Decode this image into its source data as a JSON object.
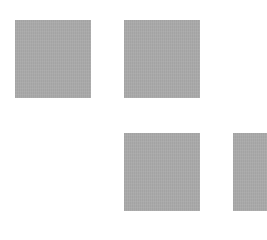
{
  "canvas": {
    "width": 267,
    "height": 224,
    "background": "#ffffff"
  },
  "tiles": [
    {
      "id": "tile-1",
      "row": 1,
      "col": 1,
      "color": "#aaaaaa"
    },
    {
      "id": "tile-2",
      "row": 1,
      "col": 2,
      "color": "#aaaaaa"
    },
    {
      "id": "tile-3",
      "row": 2,
      "col": 2,
      "color": "#aaaaaa"
    },
    {
      "id": "tile-4",
      "row": 2,
      "col": 3,
      "color": "#aaaaaa",
      "clipped": "right-edge"
    }
  ]
}
